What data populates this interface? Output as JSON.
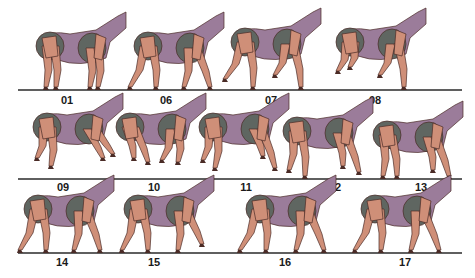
{
  "figure": {
    "type": "gait-sequence-diagram",
    "colors": {
      "body": "#9b7c9a",
      "hip_shoulder": "#5f6661",
      "limb": "#cf8f78",
      "outline": "#4a2b26",
      "ground": "#2a2a2a",
      "label": "#1a1a1a"
    },
    "rows": [
      {
        "ground": {
          "x1": 18,
          "x2": 462,
          "y": 90
        },
        "frames": [
          {
            "label": "01",
            "label_x": 67,
            "label_y": 95,
            "x": 40,
            "pose": "stand"
          },
          {
            "label": "06",
            "label_x": 166,
            "label_y": 95,
            "x": 138,
            "pose": "stride"
          },
          {
            "label": "07",
            "label_x": 271,
            "label_y": 95,
            "x": 235,
            "pose": "lift"
          },
          {
            "label": "08",
            "label_x": 375,
            "label_y": 95,
            "x": 340,
            "pose": "lift2"
          }
        ]
      },
      {
        "ground": {
          "x1": 18,
          "x2": 462,
          "y": 179
        },
        "frames": [
          {
            "label": "09",
            "label_x": 63,
            "label_y": 182,
            "x": 37,
            "pose": "gallop"
          },
          {
            "label": "10",
            "label_x": 154,
            "label_y": 182,
            "x": 120,
            "pose": "gather"
          },
          {
            "label": "11",
            "label_x": 246,
            "label_y": 182,
            "x": 203,
            "pose": "reach"
          },
          {
            "label": "12",
            "label_x": 335,
            "label_y": 182,
            "x": 287,
            "pose": "reach2"
          },
          {
            "label": "13",
            "label_x": 421,
            "label_y": 182,
            "x": 377,
            "pose": "land"
          }
        ]
      },
      {
        "ground": {
          "x1": 18,
          "x2": 462,
          "y": 253
        },
        "frames": [
          {
            "label": "14",
            "label_x": 62,
            "label_y": 257,
            "x": 28,
            "pose": "stride"
          },
          {
            "label": "15",
            "label_x": 154,
            "label_y": 257,
            "x": 128,
            "pose": "stride2"
          },
          {
            "label": "16",
            "label_x": 285,
            "label_y": 257,
            "x": 250,
            "pose": "walk"
          },
          {
            "label": "17",
            "label_x": 405,
            "label_y": 257,
            "x": 365,
            "pose": "walk"
          }
        ]
      }
    ]
  }
}
